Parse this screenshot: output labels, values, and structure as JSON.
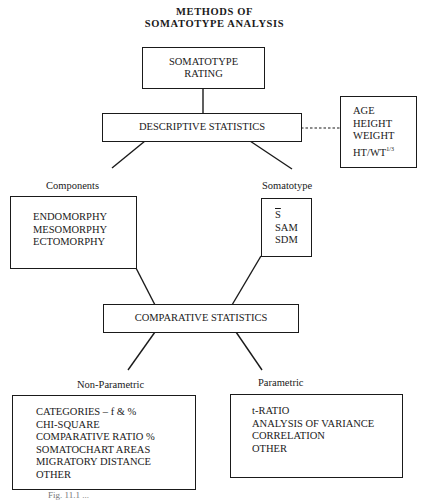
{
  "title": {
    "line1": "METHODS OF",
    "line2": "SOMATOTYPE ANALYSIS"
  },
  "nodes": {
    "rating": {
      "line1": "SOMATOTYPE",
      "line2": "RATING"
    },
    "descriptive": {
      "label": "DESCRIPTIVE STATISTICS"
    },
    "variables": {
      "items": [
        "AGE",
        "HEIGHT",
        "WEIGHT",
        "HT/WT"
      ],
      "superscript": "1/3"
    },
    "components": {
      "heading": "Components",
      "items": [
        "ENDOMORPHY",
        "MESOMORPHY",
        "ECTOMORPHY"
      ]
    },
    "somatotype": {
      "heading": "Somatotype",
      "items": [
        "S",
        "SAM",
        "SDM"
      ]
    },
    "comparative": {
      "label": "COMPARATIVE STATISTICS"
    },
    "non_parametric": {
      "heading": "Non-Parametric",
      "items": [
        "CATEGORIES – f & %",
        "CHI-SQUARE",
        "COMPARATIVE RATIO %",
        "SOMATOCHART AREAS",
        "MIGRATORY DISTANCE",
        "OTHER"
      ]
    },
    "parametric": {
      "heading": "Parametric",
      "items": [
        "t-RATIO",
        "ANALYSIS OF VARIANCE",
        "CORRELATION",
        "OTHER"
      ]
    }
  },
  "caption": "Fig. 11.1 ..."
}
